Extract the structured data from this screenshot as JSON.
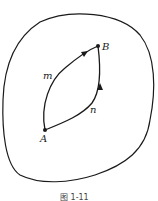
{
  "figure": {
    "points": {
      "A": "A",
      "B": "B"
    },
    "paths": {
      "upper": "m",
      "lower": "n"
    },
    "caption": "图 1-11",
    "colors": {
      "stroke": "#1a1a1a",
      "background": "#ffffff"
    }
  }
}
